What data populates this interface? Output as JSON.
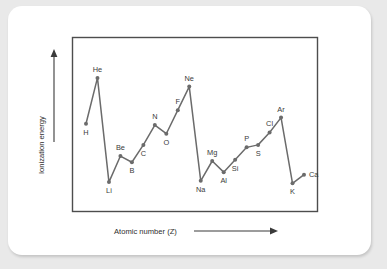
{
  "chart_data": {
    "type": "line",
    "title": "",
    "subtitle": "",
    "xlabel": "Atomic number (Z)",
    "ylabel": "Ionization energy",
    "grid": false,
    "legend": null,
    "axis_ticks": {
      "x": [],
      "y": []
    },
    "axis_arrows": {
      "x": "right",
      "y": "up"
    },
    "xlim": [
      1,
      20
    ],
    "ylim": [
      0,
      1
    ],
    "x": [
      1,
      2,
      3,
      4,
      5,
      6,
      7,
      8,
      9,
      10,
      11,
      12,
      13,
      14,
      15,
      16,
      17,
      18,
      19,
      20
    ],
    "categories": [
      "H",
      "He",
      "Li",
      "Be",
      "B",
      "C",
      "N",
      "O",
      "F",
      "Ne",
      "Na",
      "Mg",
      "Al",
      "Si",
      "P",
      "S",
      "Cl",
      "Ar",
      "K",
      "Ca"
    ],
    "point_labels": [
      "H",
      "He",
      "Li",
      "Be",
      "B",
      "C",
      "N",
      "O",
      "F",
      "Ne",
      "Na",
      "Mg",
      "Al",
      "Si",
      "P",
      "S",
      "Cl",
      "Ar",
      "K",
      "Ca"
    ],
    "values": [
      0.55,
      0.92,
      0.08,
      0.29,
      0.24,
      0.38,
      0.54,
      0.47,
      0.66,
      0.85,
      0.09,
      0.25,
      0.16,
      0.26,
      0.36,
      0.38,
      0.48,
      0.6,
      0.07,
      0.14
    ],
    "label_positions": [
      "below",
      "above",
      "below",
      "above",
      "below",
      "below",
      "above",
      "below",
      "above",
      "above",
      "below",
      "above",
      "below",
      "below",
      "above",
      "below",
      "above",
      "above",
      "below",
      "right"
    ],
    "series": [
      {
        "name": "Ionization energy",
        "color": "#6b6b6b",
        "values": [
          0.55,
          0.92,
          0.08,
          0.29,
          0.24,
          0.38,
          0.54,
          0.47,
          0.66,
          0.85,
          0.09,
          0.25,
          0.16,
          0.26,
          0.36,
          0.38,
          0.48,
          0.6,
          0.07,
          0.14
        ]
      }
    ]
  },
  "colors": {
    "page_background": "#e9e9e9",
    "card_background": "#ffffff",
    "frame_stroke": "#4d4d4d",
    "line_stroke": "#6b6b6b",
    "marker_fill": "#6b6b6b",
    "text": "#2e2e2e"
  }
}
